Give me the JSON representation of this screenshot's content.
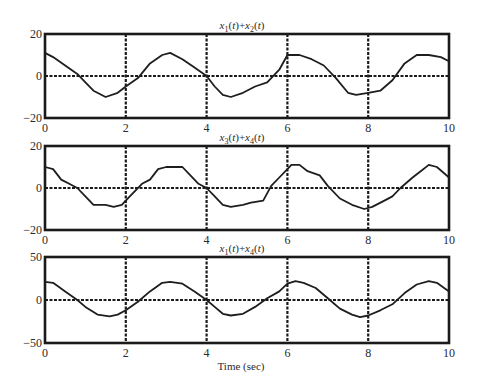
{
  "figure": {
    "xlabel": "Time (sec)",
    "xticks": [
      "0",
      "2",
      "4",
      "6",
      "8",
      "10"
    ]
  },
  "chart_data": [
    {
      "type": "line",
      "title": "x1(t)+x2(t)",
      "title_parts": {
        "a": "x",
        "a_sub": "1",
        "b": "x",
        "b_sub": "2"
      },
      "xlabel": "",
      "ylabel": "",
      "xlim": [
        0,
        10
      ],
      "ylim": [
        -20,
        20
      ],
      "yticks": [
        "20",
        "0",
        "−20"
      ],
      "grid": true,
      "series": [
        {
          "name": "x1(t)+x2(t)",
          "x": [
            0,
            0.2,
            0.5,
            0.8,
            1.0,
            1.2,
            1.5,
            1.8,
            2.0,
            2.3,
            2.6,
            2.9,
            3.1,
            3.4,
            3.7,
            4.0,
            4.2,
            4.4,
            4.6,
            4.9,
            5.2,
            5.5,
            5.8,
            6.0,
            6.3,
            6.6,
            6.9,
            7.2,
            7.5,
            7.7,
            8.0,
            8.3,
            8.6,
            8.9,
            9.2,
            9.5,
            9.8,
            10.0
          ],
          "values": [
            11,
            9,
            5,
            1,
            -3,
            -7,
            -10,
            -8,
            -5,
            -1,
            6,
            10,
            11,
            8,
            4,
            0,
            -5,
            -9,
            -10,
            -8,
            -5,
            -3,
            3,
            10,
            10,
            8,
            5,
            -1,
            -8,
            -9,
            -8,
            -7,
            -2,
            6,
            10,
            10,
            9,
            7
          ]
        }
      ]
    },
    {
      "type": "line",
      "title": "x3(t)+x4(t)",
      "title_parts": {
        "a": "x",
        "a_sub": "3",
        "b": "x",
        "b_sub": "4"
      },
      "xlabel": "",
      "ylabel": "",
      "xlim": [
        0,
        10
      ],
      "ylim": [
        -20,
        20
      ],
      "yticks": [
        "20",
        "0",
        "−20"
      ],
      "grid": true,
      "series": [
        {
          "name": "x3(t)+x4(t)",
          "x": [
            0,
            0.2,
            0.4,
            0.6,
            0.8,
            1.0,
            1.2,
            1.5,
            1.7,
            1.9,
            2.1,
            2.4,
            2.6,
            2.8,
            3.0,
            3.2,
            3.4,
            3.6,
            3.8,
            4.0,
            4.2,
            4.4,
            4.6,
            4.9,
            5.1,
            5.4,
            5.6,
            5.8,
            6.0,
            6.1,
            6.3,
            6.5,
            6.8,
            7.0,
            7.3,
            7.6,
            7.9,
            8.1,
            8.4,
            8.6,
            8.8,
            9.1,
            9.3,
            9.5,
            9.7,
            10.0
          ],
          "values": [
            10,
            9,
            4,
            2,
            0,
            -4,
            -8,
            -8,
            -9,
            -8,
            -4,
            2,
            4,
            9,
            10,
            10,
            10,
            6,
            2,
            0,
            -4,
            -8,
            -9,
            -8,
            -7,
            -6,
            1,
            5,
            9,
            11,
            11,
            8,
            6,
            1,
            -5,
            -8,
            -10,
            -9,
            -6,
            -4,
            0,
            5,
            8,
            11,
            10,
            5
          ]
        }
      ]
    },
    {
      "type": "line",
      "title": "x1(t)+x4(t)",
      "title_parts": {
        "a": "x",
        "a_sub": "1",
        "b": "x",
        "b_sub": "4"
      },
      "xlabel": "Time (sec)",
      "ylabel": "",
      "xlim": [
        0,
        10
      ],
      "ylim": [
        -50,
        50
      ],
      "yticks": [
        "50",
        "0",
        "−50"
      ],
      "grid": true,
      "series": [
        {
          "name": "x1(t)+x4(t)",
          "x": [
            0,
            0.2,
            0.5,
            0.8,
            1.0,
            1.3,
            1.6,
            1.8,
            2.0,
            2.3,
            2.6,
            2.9,
            3.1,
            3.4,
            3.7,
            4.0,
            4.2,
            4.4,
            4.6,
            4.9,
            5.2,
            5.5,
            5.8,
            6.0,
            6.2,
            6.4,
            6.7,
            7.0,
            7.3,
            7.6,
            7.8,
            8.0,
            8.3,
            8.6,
            8.9,
            9.2,
            9.5,
            9.7,
            10.0
          ],
          "values": [
            21,
            20,
            10,
            0,
            -8,
            -17,
            -19,
            -17,
            -12,
            -2,
            10,
            20,
            21,
            19,
            10,
            0,
            -8,
            -16,
            -18,
            -16,
            -8,
            2,
            10,
            19,
            22,
            20,
            14,
            2,
            -10,
            -17,
            -20,
            -18,
            -12,
            -5,
            8,
            18,
            22,
            20,
            10
          ]
        }
      ]
    }
  ]
}
